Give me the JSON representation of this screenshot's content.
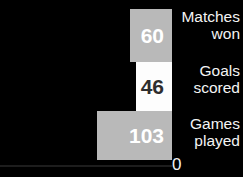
{
  "chart_data": {
    "type": "bar",
    "orientation": "horizontal",
    "title": "",
    "xlabel": "",
    "ylabel": "",
    "categories": [
      "Matches won",
      "Goals scored",
      "Games played"
    ],
    "values": [
      60,
      46,
      103
    ],
    "value_labels": [
      "60",
      "46",
      "103"
    ],
    "axis_tick_labels": [
      "0"
    ],
    "grid": false,
    "legend": false,
    "background_color": "#000000",
    "series": [
      {
        "name": "Team statistics",
        "values": [
          60,
          46,
          103
        ]
      }
    ],
    "bars": [
      {
        "category_line1": "Matches",
        "category_line2": "won",
        "category": "Matches\nwon",
        "value": 60,
        "value_label": "60",
        "fill_color": "#b9b9b9",
        "value_text_color": "#ffffff"
      },
      {
        "category_line1": "Goals",
        "category_line2": "scored",
        "category": "Goals\nscored",
        "value": 46,
        "value_label": "46",
        "fill_color": "#fdfdfd",
        "value_text_color": "#2e2e2e"
      },
      {
        "category_line1": "Games",
        "category_line2": "played",
        "category": "Games\nplayed",
        "value": 103,
        "value_label": "103",
        "fill_color": "#b9b9b9",
        "value_text_color": "#ffffff"
      }
    ]
  },
  "axis": {
    "zero_label": "0",
    "line_color": "#1d1d1d"
  },
  "colors": {
    "background": "#000000",
    "bar_gray": "#b9b9b9",
    "bar_white": "#fdfdfd",
    "label_text": "#f4f4f4"
  }
}
